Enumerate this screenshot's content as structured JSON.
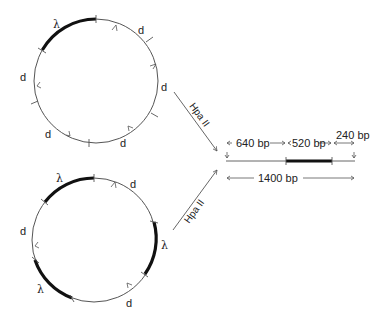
{
  "diagram": {
    "colors": {
      "line": "#555555",
      "thick": "#111111",
      "text": "#222222"
    },
    "top_circle": {
      "labels": {
        "lambda": "λ",
        "d1": "d",
        "d2": "d",
        "d3": "d",
        "d4": "d",
        "d5": "d"
      }
    },
    "bottom_circle": {
      "labels": {
        "lambda1": "λ",
        "lambda2": "λ",
        "lambda3": "λ",
        "d1": "d",
        "d2": "d",
        "d3": "d"
      }
    },
    "arrows": {
      "upper_enzyme": "Hpa II",
      "lower_enzyme": "Hpa II"
    },
    "linear_map": {
      "segment_left": "640 bp",
      "segment_middle": "520 bp",
      "segment_right": "240 bp",
      "total": "1400 bp"
    }
  }
}
